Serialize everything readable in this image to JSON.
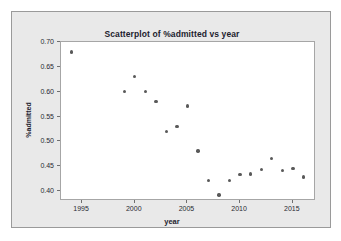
{
  "chart_data": {
    "type": "scatter",
    "title": "Scatterplot of %admitted vs year",
    "xlabel": "year",
    "ylabel": "%admitted",
    "xlim": [
      1993,
      2017.2
    ],
    "ylim": [
      0.38,
      0.7
    ],
    "xticks": [
      "1995",
      "2000",
      "2005",
      "2010",
      "2015"
    ],
    "xtick_values": [
      1995,
      2000,
      2005,
      2010,
      2015
    ],
    "yticks": [
      "0.70",
      "0.65",
      "0.60",
      "0.55",
      "0.50",
      "0.45",
      "0.40"
    ],
    "ytick_values": [
      0.7,
      0.65,
      0.6,
      0.55,
      0.5,
      0.45,
      0.4
    ],
    "grid": false,
    "legend": false,
    "marker_color": "#595959",
    "x": [
      1994,
      1999,
      2000,
      2001,
      2002,
      2003,
      2004,
      2005,
      2006,
      2007,
      2008,
      2009,
      2010,
      2011,
      2012,
      2013,
      2014,
      2015,
      2016
    ],
    "y": [
      0.68,
      0.6,
      0.631,
      0.6,
      0.58,
      0.52,
      0.53,
      0.571,
      0.481,
      0.421,
      0.392,
      0.421,
      0.433,
      0.434,
      0.443,
      0.466,
      0.442,
      0.445,
      0.428
    ],
    "points": [
      {
        "year": 1994,
        "admitted": 0.68
      },
      {
        "year": 1999,
        "admitted": 0.6
      },
      {
        "year": 2000,
        "admitted": 0.631
      },
      {
        "year": 2001,
        "admitted": 0.6
      },
      {
        "year": 2002,
        "admitted": 0.58
      },
      {
        "year": 2003,
        "admitted": 0.52
      },
      {
        "year": 2004,
        "admitted": 0.53
      },
      {
        "year": 2005,
        "admitted": 0.571
      },
      {
        "year": 2006,
        "admitted": 0.481
      },
      {
        "year": 2007,
        "admitted": 0.421
      },
      {
        "year": 2008,
        "admitted": 0.392
      },
      {
        "year": 2009,
        "admitted": 0.421
      },
      {
        "year": 2010,
        "admitted": 0.433
      },
      {
        "year": 2011,
        "admitted": 0.434
      },
      {
        "year": 2012,
        "admitted": 0.443
      },
      {
        "year": 2013,
        "admitted": 0.466
      },
      {
        "year": 2014,
        "admitted": 0.442
      },
      {
        "year": 2015,
        "admitted": 0.445
      },
      {
        "year": 2016,
        "admitted": 0.428
      }
    ]
  }
}
